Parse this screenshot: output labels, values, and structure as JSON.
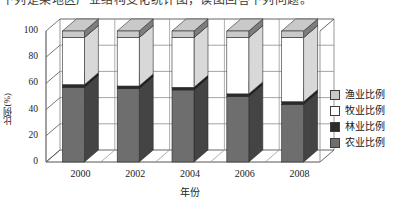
{
  "top_strip": {
    "text": "下列是某地区产业结构变化统计图，读图回答下列问题。"
  },
  "chart_data": {
    "type": "bar",
    "subtype": "stacked-column-3d",
    "title": "",
    "xlabel": "年份",
    "ylabel": "比例(%)",
    "categories": [
      "2000",
      "2002",
      "2004",
      "2006",
      "2008"
    ],
    "ylim": [
      0,
      100
    ],
    "yticks": [
      0,
      20,
      40,
      60,
      80,
      100
    ],
    "ytick_labels": [
      "0",
      "20",
      "40",
      "60",
      "80",
      "100"
    ],
    "grid": true,
    "legend_position": "right",
    "stack_order_bottom_to_top": [
      "农业比例",
      "林业比例",
      "牧业比例",
      "渔业比例"
    ],
    "series": [
      {
        "name": "农业比例",
        "color": "#6e6e6e",
        "values": [
          57,
          56,
          55,
          50,
          44
        ]
      },
      {
        "name": "林业比例",
        "color": "#2b2b2b",
        "values": [
          2,
          2,
          2,
          2,
          2
        ]
      },
      {
        "name": "牧业比例",
        "color": "#ffffff",
        "values": [
          36,
          37,
          38,
          43,
          49
        ]
      },
      {
        "name": "渔业比例",
        "color": "#c9c9c9",
        "values": [
          5,
          5,
          5,
          5,
          5
        ]
      }
    ]
  },
  "legend": {
    "entries": [
      {
        "label": "渔业比例",
        "color": "#c9c9c9"
      },
      {
        "label": "牧业比例",
        "color": "#ffffff"
      },
      {
        "label": "林业比例",
        "color": "#2b2b2b"
      },
      {
        "label": "农业比例",
        "color": "#6e6e6e"
      }
    ]
  }
}
